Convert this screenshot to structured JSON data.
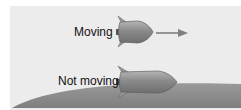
{
  "labels": {
    "moving": "Moving",
    "not_moving": "Not moving"
  },
  "colors": {
    "background": "#ececec",
    "ground": "#8c8c8c",
    "rocket_body": "#8a8a8a",
    "rocket_fin": "#9a9a9a",
    "arrow": "#808080"
  }
}
